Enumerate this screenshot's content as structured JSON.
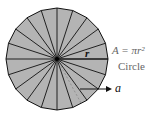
{
  "diagram": {
    "formula": "A = πr²",
    "shape_name": "Circle",
    "radius_label": "r",
    "apothem_label": "a",
    "sectors": 20,
    "colors": {
      "fill": "#b4b4b4",
      "stroke": "#111111",
      "text": "#555555"
    }
  }
}
